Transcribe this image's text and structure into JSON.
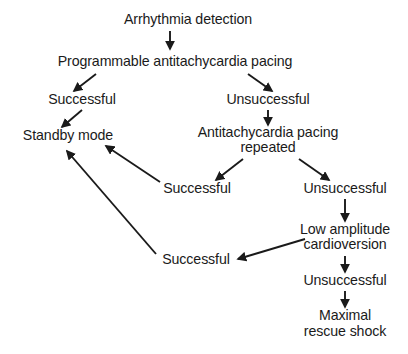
{
  "diagram": {
    "background_color": "#ffffff",
    "text_color": "#1a1a1a",
    "edge_color": "#1a1a1a",
    "nodes": [
      {
        "id": "arrhythmia-detection",
        "label": "Arrhythmia detection",
        "cx": 188,
        "cy": 20
      },
      {
        "id": "programmable-atp",
        "label": "Programmable antitachycardia pacing",
        "cx": 175,
        "cy": 62
      },
      {
        "id": "successful-1",
        "label": "Successful",
        "cx": 82,
        "cy": 100
      },
      {
        "id": "unsuccessful-1",
        "label": "Unsuccessful",
        "cx": 268,
        "cy": 100
      },
      {
        "id": "standby-mode",
        "label": "Standby mode",
        "cx": 68,
        "cy": 136
      },
      {
        "id": "atp-repeated-line1",
        "label": "Antitachycardia pacing",
        "cx": 268,
        "cy": 133
      },
      {
        "id": "atp-repeated-line2",
        "label": "repeated",
        "cx": 268,
        "cy": 148
      },
      {
        "id": "successful-2",
        "label": "Successful",
        "cx": 197,
        "cy": 189
      },
      {
        "id": "unsuccessful-2",
        "label": "Unsuccessful",
        "cx": 345,
        "cy": 189
      },
      {
        "id": "low-amplitude-line1",
        "label": "Low amplitude",
        "cx": 345,
        "cy": 230
      },
      {
        "id": "low-amplitude-line2",
        "label": "cardioversion",
        "cx": 345,
        "cy": 245
      },
      {
        "id": "successful-3",
        "label": "Successful",
        "cx": 196,
        "cy": 260
      },
      {
        "id": "unsuccessful-3",
        "label": "Unsuccessful",
        "cx": 345,
        "cy": 281
      },
      {
        "id": "maximal-shock-line1",
        "label": "Maximal",
        "cx": 345,
        "cy": 316
      },
      {
        "id": "maximal-shock-line2",
        "label": "rescue shock",
        "cx": 345,
        "cy": 332
      }
    ],
    "edges": [
      {
        "id": "edge-detection-to-atp",
        "from": "arrhythmia-detection",
        "to": "programmable-atp",
        "x1": 170,
        "y1": 31,
        "x2": 170,
        "y2": 49
      },
      {
        "id": "edge-atp-to-successful1",
        "from": "programmable-atp",
        "to": "successful-1",
        "x1": 96,
        "y1": 74,
        "x2": 74,
        "y2": 91
      },
      {
        "id": "edge-atp-to-unsuccessful1",
        "from": "programmable-atp",
        "to": "unsuccessful-1",
        "x1": 248,
        "y1": 74,
        "x2": 272,
        "y2": 91
      },
      {
        "id": "edge-successful1-to-standby",
        "from": "successful-1",
        "to": "standby-mode",
        "x1": 82,
        "y1": 110,
        "x2": 62,
        "y2": 127
      },
      {
        "id": "edge-unsuccessful1-to-repeated",
        "from": "unsuccessful-1",
        "to": "atp-repeated-line1",
        "x1": 268,
        "y1": 110,
        "x2": 268,
        "y2": 125
      },
      {
        "id": "edge-repeated-to-successful2",
        "from": "atp-repeated-line2",
        "to": "successful-2",
        "x1": 243,
        "y1": 159,
        "x2": 216,
        "y2": 180
      },
      {
        "id": "edge-repeated-to-unsuccessful2",
        "from": "atp-repeated-line2",
        "to": "unsuccessful-2",
        "x1": 299,
        "y1": 159,
        "x2": 329,
        "y2": 180
      },
      {
        "id": "edge-successful2-to-standby",
        "from": "successful-2",
        "to": "standby-mode",
        "x1": 160,
        "y1": 182,
        "x2": 106,
        "y2": 146
      },
      {
        "id": "edge-unsuccessful2-to-lowamp",
        "from": "unsuccessful-2",
        "to": "low-amplitude-line1",
        "x1": 345,
        "y1": 199,
        "x2": 345,
        "y2": 221
      },
      {
        "id": "edge-lowamp-to-successful3",
        "from": "low-amplitude-line1",
        "to": "successful-3",
        "x1": 305,
        "y1": 239,
        "x2": 238,
        "y2": 259
      },
      {
        "id": "edge-successful3-to-standby",
        "from": "successful-3",
        "to": "standby-mode",
        "x1": 156,
        "y1": 254,
        "x2": 67,
        "y2": 151
      },
      {
        "id": "edge-lowamp-to-unsuccessful3",
        "from": "low-amplitude-line2",
        "to": "unsuccessful-3",
        "x1": 345,
        "y1": 256,
        "x2": 345,
        "y2": 272
      },
      {
        "id": "edge-unsuccessful3-to-maximal",
        "from": "unsuccessful-3",
        "to": "maximal-shock-line1",
        "x1": 345,
        "y1": 291,
        "x2": 345,
        "y2": 307
      }
    ]
  }
}
